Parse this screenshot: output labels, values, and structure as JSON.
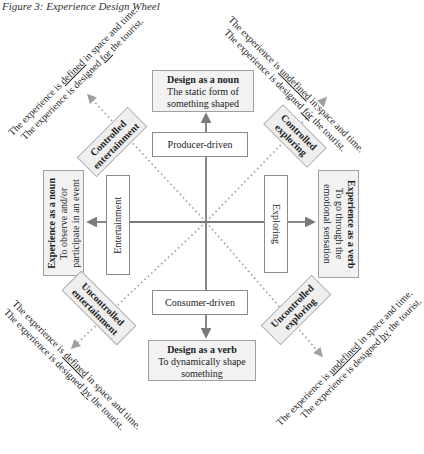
{
  "figure": {
    "title": "Figure 3:  Experience Design Wheel"
  },
  "axes": {
    "top": {
      "title": "Design as a noun",
      "line1": "The static form of",
      "line2": "something shaped"
    },
    "top_inner": "Producer-driven",
    "bottom_inner": "Consumer-driven",
    "bottom": {
      "title": "Design as a verb",
      "line1": "To dynamically shape",
      "line2": "something"
    },
    "left_inner": "Entertainment",
    "left": {
      "title": "Experience as a noun",
      "line1": "To observe and/or",
      "line2": "participate in an event"
    },
    "right_inner": "Exploring",
    "right": {
      "title": "Experience as a verb",
      "line1": "To go through the",
      "line2": "emotional sensation"
    }
  },
  "quadrants": {
    "top_left": {
      "label_line1": "Controlled",
      "label_line2": "entertainment",
      "desc1_a": "The experience is ",
      "desc1_u": "defined",
      "desc1_b": " in space and time.",
      "desc2_a": "The experience is designed ",
      "desc2_u": "for",
      "desc2_b": " the tourist."
    },
    "top_right": {
      "label_line1": "Controlled",
      "label_line2": "exploring",
      "desc1_a": "The experience is ",
      "desc1_u": "undefined",
      "desc1_b": " in space and time.",
      "desc2_a": "The experience is designed ",
      "desc2_u": "for",
      "desc2_b": " the tourist."
    },
    "bottom_left": {
      "label_line1": "Uncontrolled",
      "label_line2": "entertainment",
      "desc1_a": "The experience is ",
      "desc1_u": "defined",
      "desc1_b": " in space and time.",
      "desc2_a": "The experience is designed ",
      "desc2_u": "by",
      "desc2_b": " the tourist."
    },
    "bottom_right": {
      "label_line1": "Uncontrolled",
      "label_line2": "exploring",
      "desc1_a": "The experience is ",
      "desc1_u": "undefined",
      "desc1_b": " in space and time.",
      "desc2_a": "The experience is designed ",
      "desc2_u": "by",
      "desc2_b": " the tourist."
    }
  },
  "colors": {
    "line": "#7a7a7a",
    "dotted": "#9a9a9a",
    "box_border": "#8a8a8a",
    "shaded_fill": "#f2f2f2"
  }
}
